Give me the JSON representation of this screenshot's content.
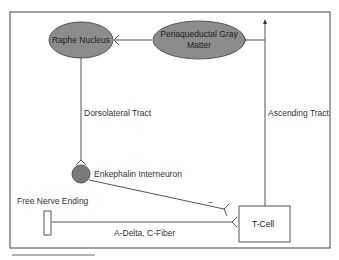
{
  "diagram": {
    "nodes": {
      "raphe": {
        "label": "Raphe Nucleus",
        "shape": "ellipse",
        "fill": "#8c8c8c"
      },
      "pag": {
        "label_line1": "Periaqueductal Gray",
        "label_line2": "Matter",
        "shape": "ellipse",
        "fill": "#8c8c8c"
      },
      "enkephalin": {
        "label": "Enkephalin Interneuron",
        "shape": "circle",
        "fill": "#7a7a7a"
      },
      "free_nerve": {
        "label": "Free Nerve Ending",
        "shape": "rectangle"
      },
      "tcell": {
        "label": "T-Cell",
        "shape": "rectangle"
      }
    },
    "edges": {
      "dorsolateral": {
        "label": "Dorsolateral Tract"
      },
      "ascending": {
        "label": "Ascending Tract"
      },
      "fiber": {
        "label": "A-Delta, C-Fiber"
      },
      "inhibitory": {
        "label": "−"
      }
    },
    "colors": {
      "stroke": "#555555",
      "frame": "#444444",
      "node_fill": "#8c8c8c"
    }
  }
}
